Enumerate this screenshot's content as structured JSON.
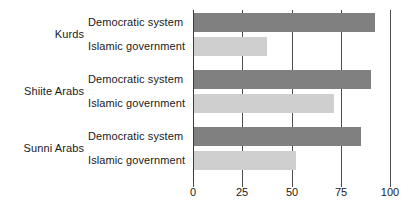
{
  "chart_data": {
    "type": "bar",
    "orientation": "horizontal",
    "title": "",
    "xlabel": "",
    "ylabel": "",
    "xlim": [
      0,
      100
    ],
    "xticks": [
      0,
      25,
      50,
      75,
      100
    ],
    "grid": true,
    "legend": "none",
    "categories": [
      "Kurds",
      "Shiite Arabs",
      "Sunni Arabs"
    ],
    "series": [
      {
        "name": "Democratic system",
        "color": "#808080",
        "values": [
          92,
          90,
          85
        ]
      },
      {
        "name": "Islamic government",
        "color": "#cfcfcf",
        "values": [
          37,
          71,
          52
        ]
      }
    ]
  },
  "groups": [
    {
      "label": "Kurds",
      "bars": [
        {
          "label": "Democratic system",
          "value": 92,
          "series": "democratic"
        },
        {
          "label": "Islamic government",
          "value": 37,
          "series": "islamic"
        }
      ]
    },
    {
      "label": "Shiite Arabs",
      "bars": [
        {
          "label": "Democratic system",
          "value": 90,
          "series": "democratic"
        },
        {
          "label": "Islamic government",
          "value": 71,
          "series": "islamic"
        }
      ]
    },
    {
      "label": "Sunni Arabs",
      "bars": [
        {
          "label": "Democratic system",
          "value": 85,
          "series": "democratic"
        },
        {
          "label": "Islamic government",
          "value": 52,
          "series": "islamic"
        }
      ]
    }
  ],
  "axis": {
    "ticks": [
      "0",
      "25",
      "50",
      "75",
      "100"
    ],
    "tick_values": [
      0,
      25,
      50,
      75,
      100
    ],
    "max": 100
  },
  "colors": {
    "democratic": "#808080",
    "islamic": "#cfcfcf",
    "gridline": "#4d4d4d",
    "text": "#1a1a1a",
    "background": "#ffffff"
  }
}
